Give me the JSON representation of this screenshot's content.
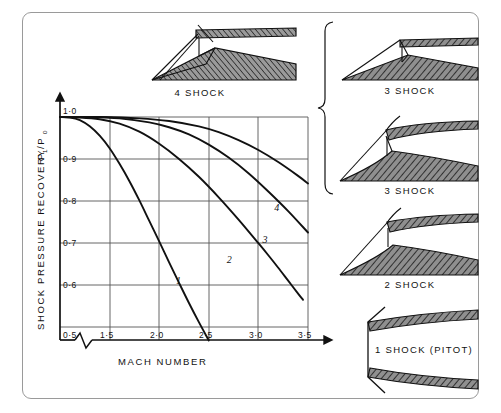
{
  "figure": {
    "background_color": "#ffffff",
    "frame_color": "#9a9a9a",
    "ink_color": "#111111",
    "grid_color": "#555555",
    "hatch_color": "#111111",
    "fill_gray": "#8f8f8f"
  },
  "chart_data": {
    "type": "line",
    "title": "",
    "xlabel": "MACH NUMBER",
    "ylabel": "SHOCK PRESSURE RECOVERY",
    "ylabel_symbol_main": "P",
    "ylabel_symbol_sub1": "1",
    "ylabel_symbol_sep": "/P",
    "ylabel_symbol_sub2": "0",
    "xlim": [
      1.0,
      3.5
    ],
    "ylim": [
      0.5,
      1.0
    ],
    "xticks": [
      "1·5",
      "2·0",
      "2·5",
      "3·0",
      "3·5"
    ],
    "xtick_values": [
      1.5,
      2.0,
      2.5,
      3.0,
      3.5
    ],
    "yticks": [
      "0·5",
      "0·6",
      "0·7",
      "0·8",
      "0·9",
      "1·0"
    ],
    "ytick_values": [
      0.5,
      0.6,
      0.7,
      0.8,
      0.9,
      1.0
    ],
    "axis_break": true,
    "axis_break_note": "zig-zag break on x-axis between 0·5 label and 1·5 tick",
    "grid": true,
    "legend_position": "inline-curve-labels",
    "series": [
      {
        "name": "1",
        "label": "1",
        "label_x": 2.17,
        "label_y": 0.625,
        "points": [
          [
            1.0,
            1.0
          ],
          [
            1.1,
            0.999
          ],
          [
            1.2,
            0.993
          ],
          [
            1.3,
            0.979
          ],
          [
            1.4,
            0.958
          ],
          [
            1.5,
            0.93
          ],
          [
            1.6,
            0.895
          ],
          [
            1.7,
            0.856
          ],
          [
            1.8,
            0.813
          ],
          [
            1.9,
            0.767
          ],
          [
            2.0,
            0.721
          ],
          [
            2.1,
            0.674
          ],
          [
            2.2,
            0.628
          ],
          [
            2.3,
            0.583
          ],
          [
            2.4,
            0.54
          ],
          [
            2.5,
            0.499
          ]
        ]
      },
      {
        "name": "2",
        "label": "2",
        "label_x": 2.68,
        "label_y": 0.672,
        "points": [
          [
            1.0,
            1.0
          ],
          [
            1.2,
            0.999
          ],
          [
            1.4,
            0.995
          ],
          [
            1.6,
            0.985
          ],
          [
            1.8,
            0.967
          ],
          [
            2.0,
            0.94
          ],
          [
            2.2,
            0.906
          ],
          [
            2.4,
            0.866
          ],
          [
            2.6,
            0.82
          ],
          [
            2.8,
            0.77
          ],
          [
            3.0,
            0.717
          ],
          [
            3.1,
            0.69
          ],
          [
            3.2,
            0.662
          ],
          [
            3.3,
            0.633
          ],
          [
            3.4,
            0.604
          ],
          [
            3.45,
            0.59
          ]
        ]
      },
      {
        "name": "3",
        "label": "3",
        "label_x": 3.04,
        "label_y": 0.718,
        "points": [
          [
            1.0,
            1.0
          ],
          [
            1.3,
            1.0
          ],
          [
            1.6,
            0.997
          ],
          [
            1.9,
            0.988
          ],
          [
            2.1,
            0.977
          ],
          [
            2.3,
            0.961
          ],
          [
            2.5,
            0.938
          ],
          [
            2.7,
            0.909
          ],
          [
            2.9,
            0.874
          ],
          [
            3.1,
            0.833
          ],
          [
            3.3,
            0.789
          ],
          [
            3.5,
            0.741
          ]
        ]
      },
      {
        "name": "4",
        "label": "4",
        "label_x": 3.16,
        "label_y": 0.79,
        "points": [
          [
            1.0,
            1.0
          ],
          [
            1.4,
            1.0
          ],
          [
            1.8,
            0.997
          ],
          [
            2.1,
            0.991
          ],
          [
            2.4,
            0.979
          ],
          [
            2.6,
            0.966
          ],
          [
            2.8,
            0.948
          ],
          [
            3.0,
            0.926
          ],
          [
            3.2,
            0.899
          ],
          [
            3.4,
            0.868
          ],
          [
            3.5,
            0.851
          ]
        ]
      }
    ]
  },
  "diagrams": {
    "top": {
      "label": "4 SHOCK",
      "shock_count": 4
    },
    "right": [
      {
        "label": "3 SHOCK",
        "shock_count": 3,
        "ramp": "double-wedge"
      },
      {
        "label": "3 SHOCK",
        "shock_count": 3,
        "ramp": "isentropic-curved"
      },
      {
        "label": "2 SHOCK",
        "shock_count": 2,
        "ramp": "single-wedge"
      },
      {
        "label": "1 SHOCK (PITOT)",
        "shock_count": 1,
        "ramp": "normal-shock-pitot"
      }
    ],
    "brace_note": "curly brace grouping the two 3 SHOCK diagrams"
  }
}
